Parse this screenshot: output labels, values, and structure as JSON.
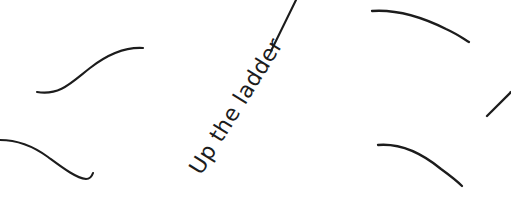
{
  "canvas": {
    "width": 511,
    "height": 211,
    "background_color": "#ffffff",
    "ink_color": "#1c1c1c"
  },
  "labels": [
    {
      "id": "up-the-ladder",
      "text": "Up the ladder",
      "x": 201,
      "y": 176,
      "rotation_deg": -58,
      "font_size": 22,
      "color": "#1c1c1c"
    }
  ],
  "strokes": [
    {
      "id": "upper-left-s-curve",
      "shape": "s-curve",
      "path": "M 37 92 C 60 96 72 82 90 68 C 108 54 126 47 143 48",
      "stroke_width": 2.1
    },
    {
      "id": "lower-left-descending-curve",
      "shape": "descending-curve-with-hook",
      "path": "M 0 140 C 18 140 33 146 48 157 C 63 168 76 178 86 179 C 90 179 92 176 93 173",
      "stroke_width": 2.1
    },
    {
      "id": "center-diagonal-line",
      "shape": "straight-diagonal",
      "path": "M 271 51 L 296 0",
      "stroke_width": 2.1
    },
    {
      "id": "upper-right-arc",
      "shape": "arc",
      "path": "M 372 11 C 400 9 426 19 446 29 C 457 34 464 39 469 42",
      "stroke_width": 2.3
    },
    {
      "id": "lower-right-arc",
      "shape": "arc",
      "path": "M 378 145 C 402 143 424 155 441 169 C 452 177 458 182 462 186",
      "stroke_width": 2.3
    },
    {
      "id": "far-right-edge-diagonal",
      "shape": "short-diagonal",
      "path": "M 487 116 C 495 108 503 100 511 92",
      "stroke_width": 2.3
    }
  ]
}
